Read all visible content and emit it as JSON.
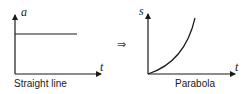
{
  "diagram": {
    "left_graph": {
      "y_label": "a",
      "x_label": "t",
      "caption": "Straight line"
    },
    "implies_symbol": "⇒",
    "right_graph": {
      "y_label": "s",
      "x_label": "t",
      "caption": "Parabola"
    },
    "colors": {
      "line": "#1a1a1a",
      "background": "#ffffff"
    }
  }
}
